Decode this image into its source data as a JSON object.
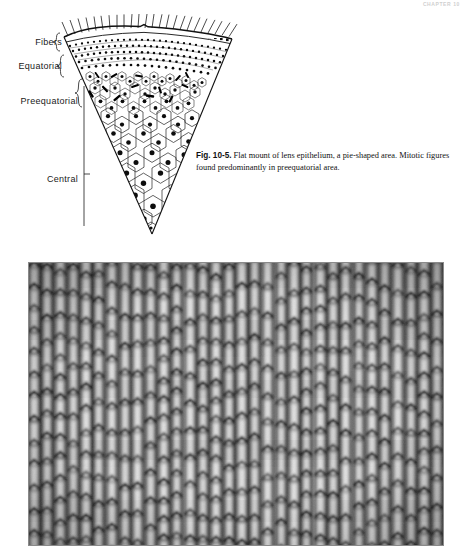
{
  "running_head": "CHAPTER 10",
  "figure_diagram": {
    "name": "flat-mount-lens-epithelium-wedge",
    "zones": [
      {
        "id": "fibers",
        "label": "Fibers",
        "description": "lens fiber hatching at the outermost rim of the pie-shaped wedge"
      },
      {
        "id": "equatorial",
        "label": "Equatorial",
        "description": "densely packed small epithelial nuclei band"
      },
      {
        "id": "preequatorial",
        "label": "Preequatorial",
        "description": "hexagonal cells containing numerous dark rod-like mitotic figures"
      },
      {
        "id": "central",
        "label": "Central",
        "description": "large hexagonal epithelial cells, each with a single round nucleus"
      }
    ],
    "bracket_glyph": "{"
  },
  "caption": {
    "figure_number": "Fig. 10-5.",
    "text": " Flat mount of lens epithelium, a pie-shaped area. Mitotic figures found predominantly in preequatorial area."
  },
  "figure_photo": {
    "name": "lens-fibers-photomicrograph",
    "alt": "Photomicrograph of lens fibers in flat section: regular vertical columns of elongated hexagonal fibers with dark cell boundaries",
    "tone_dark": "#1d1d1d",
    "tone_mid": "#8d8d8d",
    "tone_light": "#dedede"
  }
}
